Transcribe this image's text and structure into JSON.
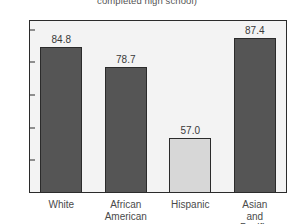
{
  "chart_data": {
    "type": "bar",
    "title": "completed high school)",
    "xlabel": "",
    "ylabel": "",
    "ylim": [
      40,
      93
    ],
    "yticks": [
      40,
      50,
      60,
      70,
      80,
      90
    ],
    "grid": false,
    "legend": "none",
    "categories": [
      "White",
      "African\nAmerican",
      "Hispanic",
      "Asian and\nPacific Islander"
    ],
    "values": [
      84.8,
      78.7,
      57.0,
      87.4
    ],
    "value_labels": [
      "84.8",
      "78.7",
      "57.0",
      "87.4"
    ],
    "bar_colors": [
      "#555555",
      "#555555",
      "#d7d7d7",
      "#555555"
    ],
    "bar_edge_color": "#2b2b2b",
    "plot_background": "#f3f3f3",
    "frame_color": "#2b2b2b"
  }
}
